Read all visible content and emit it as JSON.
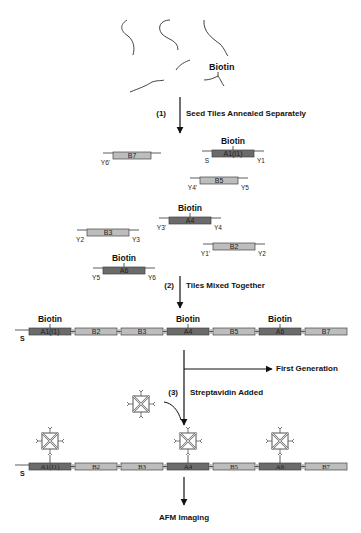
{
  "colors": {
    "dark_tile": "#6b6b6b",
    "light_tile": "#bdbdbd",
    "tile_border": "#444444",
    "line": "#333333",
    "text": "#111111"
  },
  "raw_strands": {
    "biotin_label": "Biotin"
  },
  "steps": [
    {
      "number": "(1)",
      "label": "Seed Tiles Annealed Separately"
    },
    {
      "number": "(2)",
      "label": "Tiles Mixed Together"
    },
    {
      "number": "(3)",
      "label": "Streptavidin Added"
    }
  ],
  "separate_tiles": [
    {
      "id": "B7",
      "type": "light",
      "biotin": false,
      "left_end": "Y6'",
      "right_end": ""
    },
    {
      "id": "A1(I1)",
      "type": "dark",
      "biotin": true,
      "left_end": "S",
      "right_end": "Y1"
    },
    {
      "id": "B5",
      "type": "light",
      "biotin": false,
      "left_end": "Y4'",
      "right_end": "Y5"
    },
    {
      "id": "A4",
      "type": "dark",
      "biotin": true,
      "left_end": "Y3'",
      "right_end": "Y4"
    },
    {
      "id": "B3",
      "type": "light",
      "biotin": false,
      "left_end": "Y2",
      "right_end": "Y3"
    },
    {
      "id": "B2",
      "type": "light",
      "biotin": false,
      "left_end": "Y1'",
      "right_end": "Y2"
    },
    {
      "id": "A6",
      "type": "dark",
      "biotin": true,
      "left_end": "Y5",
      "right_end": "Y6"
    }
  ],
  "biotin_label": "Biotin",
  "assembled_row": {
    "start_label": "S",
    "tiles": [
      {
        "id": "A1(I1)",
        "type": "dark",
        "biotin": true
      },
      {
        "id": "B2",
        "type": "light",
        "biotin": false
      },
      {
        "id": "B3",
        "type": "light",
        "biotin": false
      },
      {
        "id": "A4",
        "type": "dark",
        "biotin": true
      },
      {
        "id": "B5",
        "type": "light",
        "biotin": false
      },
      {
        "id": "A6",
        "type": "dark",
        "biotin": true
      },
      {
        "id": "B7",
        "type": "light",
        "biotin": false
      }
    ]
  },
  "branch_label": "First Generation",
  "final_label": "AFM Imaging"
}
